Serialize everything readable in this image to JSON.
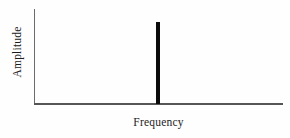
{
  "chart_data": {
    "type": "bar",
    "title": "",
    "subtitle": "",
    "xlabel": "Frequency",
    "ylabel": "Amplitude",
    "categories": [
      "f0"
    ],
    "values": [
      0.85
    ],
    "x": [
      0.497
    ],
    "xlim": [
      0,
      1
    ],
    "ylim": [
      0,
      1
    ],
    "grid": false,
    "legend": null,
    "xticks": [],
    "yticks": [],
    "xticklabels": [],
    "yticklabels": [],
    "annotations": [],
    "series": [
      {
        "name": "spectrum",
        "values": [
          0.85
        ]
      }
    ],
    "bar_width_fraction": 0.018
  },
  "style": {
    "background": "#fefefe",
    "axis_color": "#555555",
    "yaxis_color": "#6b6b6b",
    "spike_color": "#0b0b0b",
    "label_color": "#1c1c1c"
  }
}
